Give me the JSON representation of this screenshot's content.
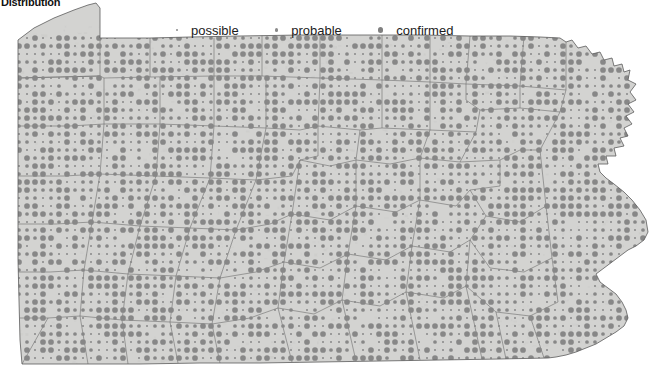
{
  "title": "Distribution",
  "legend": {
    "items": [
      {
        "label": "possible",
        "size_class": "possible",
        "dot_px": 2.0,
        "color": "#8a8a8a"
      },
      {
        "label": "probable",
        "size_class": "probable",
        "dot_px": 3.5,
        "color": "#8a8a8a"
      },
      {
        "label": "confirmed",
        "size_class": "confirmed",
        "dot_px": 5.5,
        "color": "#808080"
      }
    ]
  },
  "map": {
    "region_name": "Pennsylvania",
    "fill_color": "#d3d3d1",
    "border_color": "#5a5a5a",
    "county_border_color": "#6d6d6d",
    "dot_color": "#878787",
    "grid_spacing_px": 8,
    "background_color": "#ffffff"
  },
  "chart_data": {
    "type": "map",
    "title": "Distribution",
    "legend_entries": [
      "possible",
      "probable",
      "confirmed"
    ],
    "legend_marker_sizes_px": [
      2.0,
      3.5,
      5.5
    ],
    "marker_color": "#878787",
    "region": "Pennsylvania",
    "grid_spacing_px": 8,
    "categories": {
      "possible": "smallest dot",
      "probable": "medium dot",
      "confirmed": "largest dot"
    }
  }
}
